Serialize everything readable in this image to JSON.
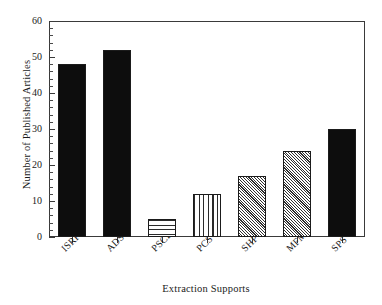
{
  "chart_data": {
    "type": "bar",
    "title": "",
    "xlabel": "Extraction Supports",
    "ylabel": "Number of Published Articles",
    "categories": [
      "ISRP",
      "ADS",
      "PSCL",
      "PCS",
      "SHP",
      "MFM",
      "SPS"
    ],
    "values": [
      48,
      52,
      5,
      12,
      17,
      24,
      30
    ],
    "ylim": [
      0,
      60
    ],
    "yticks": [
      0,
      10,
      20,
      30,
      40,
      50,
      60
    ],
    "ytick_labels": [
      "0",
      "10",
      "20",
      "30",
      "40",
      "50",
      "60"
    ],
    "minor_tick_interval": 2,
    "grid": false,
    "legend": null,
    "bar_fills": [
      "solid",
      "solid",
      "horizontal-lines",
      "vertical-lines",
      "crosshatch",
      "crosshatch",
      "solid"
    ],
    "colors": {
      "solid": "#0d0d0d",
      "pattern_line": "#2a2a2a",
      "axis": "#3a3a3a",
      "background": "#ffffff",
      "text": "#1a1a1a"
    },
    "xtick_label_rotation": -45
  }
}
